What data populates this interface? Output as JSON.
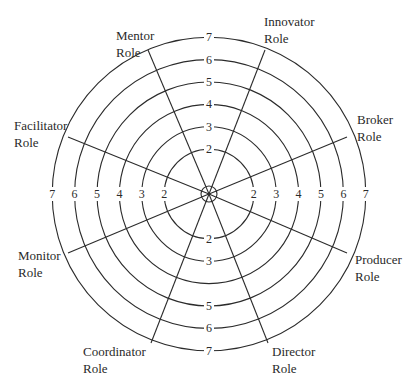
{
  "diagram": {
    "type": "competing-values-role-wheel",
    "center": [
      209,
      194
    ],
    "unit_px": 22.4,
    "rings": [
      1,
      2,
      3,
      4,
      5,
      6,
      7
    ],
    "roles": [
      {
        "name": "Mentor",
        "line1": "Mentor",
        "line2": "Role",
        "end": [
          148,
          50
        ],
        "label_pos": [
          116,
          27
        ]
      },
      {
        "name": "Innovator",
        "line1": "Innovator",
        "line2": "Role",
        "end": [
          265,
          50
        ],
        "label_pos": [
          264,
          13
        ]
      },
      {
        "name": "Broker",
        "line1": "Broker",
        "line2": "Role",
        "end": [
          347,
          137
        ],
        "label_pos": [
          357,
          111
        ]
      },
      {
        "name": "Producer",
        "line1": "Producer",
        "line2": "Role",
        "end": [
          347,
          253
        ],
        "label_pos": [
          355,
          251
        ]
      },
      {
        "name": "Director",
        "line1": "Director",
        "line2": "Role",
        "end": [
          268,
          343
        ],
        "label_pos": [
          272,
          343
        ]
      },
      {
        "name": "Coordinator",
        "line1": "Coordinator",
        "line2": "Role",
        "end": [
          151,
          343
        ],
        "label_pos": [
          83,
          343
        ]
      },
      {
        "name": "Monitor",
        "line1": "Monitor",
        "line2": "Role",
        "end": [
          68,
          253
        ],
        "label_pos": [
          18,
          247
        ]
      },
      {
        "name": "Facilitator",
        "line1": "Facilitator",
        "line2": "Role",
        "end": [
          68,
          137
        ],
        "label_pos": [
          14,
          117
        ]
      }
    ],
    "scale_labels": {
      "top": [
        "2",
        "3",
        "4",
        "5",
        "6",
        "7"
      ],
      "bottom": [
        "2",
        "3",
        "",
        "5",
        "6",
        "7"
      ],
      "left": [
        "2",
        "3",
        "4",
        "5",
        "6",
        "7"
      ],
      "right": [
        "2",
        "3",
        "4",
        "5",
        "6",
        "7"
      ]
    }
  }
}
